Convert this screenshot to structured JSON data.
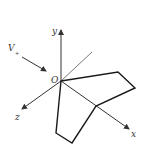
{
  "diagram": {
    "type": "3d-coordinate-axes-with-folded-plane",
    "axes": {
      "x_label": "x",
      "y_label": "y",
      "z_label": "z",
      "origin_label": "O"
    },
    "velocity": {
      "label": "V",
      "subscript": "+"
    },
    "colors": {
      "line": "#333333",
      "shape": "#1a1a1a",
      "background": "#ffffff"
    }
  }
}
